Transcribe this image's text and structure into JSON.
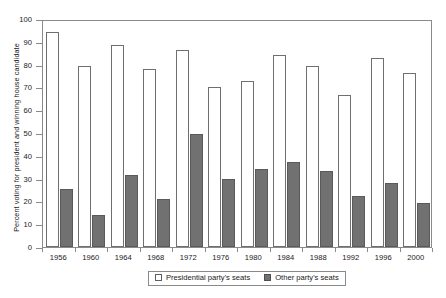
{
  "chart_data": {
    "type": "bar",
    "title": "",
    "subtitle": "",
    "xlabel": "",
    "ylabel": "Percent voting for president and winning house candidate",
    "categories": [
      "1956",
      "1960",
      "1964",
      "1968",
      "1972",
      "1976",
      "1980",
      "1984",
      "1988",
      "1992",
      "1996",
      "2000"
    ],
    "series": [
      {
        "name": "Presidential party's seats",
        "color": "#ffffff",
        "edge_color": "#6f6f6f",
        "values": [
          94.5,
          79.5,
          88.5,
          78,
          86.5,
          70,
          73,
          84,
          79.5,
          66.5,
          83,
          76.5
        ]
      },
      {
        "name": "Other party's seats",
        "color": "#717171",
        "edge_color": "#5a5a5a",
        "values": [
          25.5,
          14,
          31.5,
          21,
          49.5,
          30,
          34,
          37.5,
          33.5,
          22.5,
          28,
          19.5
        ]
      }
    ],
    "ylim": [
      0,
      100
    ],
    "yticks": [
      0,
      10,
      20,
      30,
      40,
      50,
      60,
      70,
      80,
      90,
      100
    ],
    "ytick_labels": [
      "0",
      "10",
      "20",
      "30",
      "40",
      "50",
      "60",
      "70",
      "80",
      "90",
      "100"
    ],
    "grid": false,
    "legend_position": "bottom-center",
    "legend": [
      "Presidential party's seats",
      "Other party's seats"
    ]
  }
}
